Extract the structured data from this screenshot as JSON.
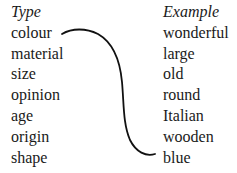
{
  "diagram": {
    "left_column": {
      "header": "Type",
      "items": [
        "colour",
        "material",
        "size",
        "opinion",
        "age",
        "origin",
        "shape"
      ]
    },
    "right_column": {
      "header": "Example",
      "items": [
        "wonderful",
        "large",
        "old",
        "round",
        "Italian",
        "wooden",
        "blue"
      ]
    },
    "connector": {
      "from": "colour",
      "to": "blue",
      "color": "#111111"
    }
  }
}
